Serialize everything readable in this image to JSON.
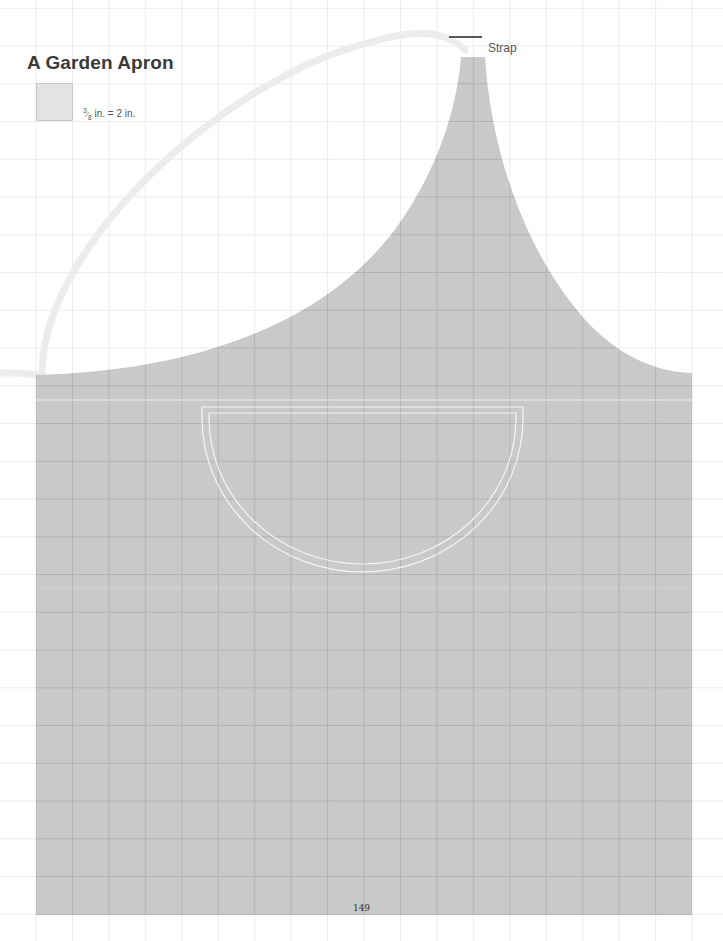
{
  "document": {
    "title": "A Garden Apron",
    "scale": {
      "fraction": "3/8",
      "fraction_numerator": "3",
      "fraction_denominator": "8",
      "label_suffix": " in. = 2 in.",
      "meaning": "each grid square = 2 in."
    },
    "labels": {
      "strap": "Strap"
    },
    "page_number": "149"
  },
  "pattern": {
    "pieces": [
      "apron body with bib",
      "strap",
      "half-circle pocket"
    ],
    "grid": {
      "columns_across_apron": 18,
      "rows_down_apron": 15
    },
    "colors": {
      "apron_fill": "#c9c9c9",
      "grid_line_on_apron": "#b3b3b3",
      "grid_line_on_paper": "#ececec",
      "strap": "#ececec",
      "pocket_outline": "#f4f4f4",
      "leader_line": "#222222"
    }
  }
}
